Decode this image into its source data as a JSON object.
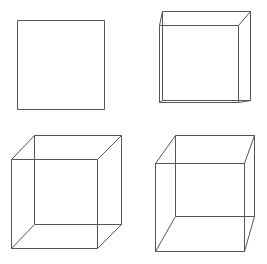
{
  "figures": [
    {
      "id": "square",
      "type": "square",
      "front": {
        "x1": 17,
        "y1": 20,
        "x2": 104,
        "y2": 109
      }
    },
    {
      "id": "shallow-cube",
      "type": "wireframe-cube",
      "front": {
        "x1": 159,
        "y1": 25,
        "x2": 238,
        "y2": 102
      },
      "back": {
        "x1": 162,
        "y1": 11,
        "x2": 250,
        "y2": 100
      }
    },
    {
      "id": "cube-left",
      "type": "wireframe-cube",
      "front": {
        "x1": 11,
        "y1": 159,
        "x2": 97,
        "y2": 248
      },
      "back": {
        "x1": 34,
        "y1": 135,
        "x2": 121,
        "y2": 224
      }
    },
    {
      "id": "cube-right",
      "type": "wireframe-cube",
      "front": {
        "x1": 155,
        "y1": 163,
        "x2": 244,
        "y2": 251
      },
      "back": {
        "x1": 175,
        "y1": 135,
        "x2": 254,
        "y2": 216
      }
    }
  ],
  "stroke_color": "#555555"
}
